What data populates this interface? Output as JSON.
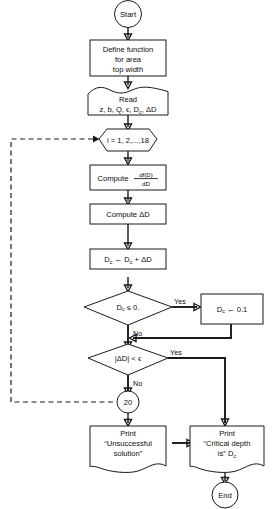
{
  "diagram": {
    "type": "flowchart",
    "stroke_color": "#1a1a1a",
    "background_color": "#ffffff"
  },
  "nodes": {
    "start": {
      "label": "Start",
      "shape": "terminator-circle"
    },
    "define": {
      "line1": "Define function",
      "line2": "for area",
      "line3": "top width",
      "shape": "process-box"
    },
    "read": {
      "line1": "Read",
      "line2": "z, b, Q, ϵ, D",
      "line2_sub": "c",
      "line2_tail": ", ΔD",
      "shape": "input-document"
    },
    "loop": {
      "label": "i = 1, 2,...,18",
      "shape": "hexagon-loop"
    },
    "compute_deriv": {
      "label": "Compute",
      "numerator": "df(D)",
      "denominator": "dD",
      "shape": "process-box"
    },
    "compute_dd": {
      "label": "Compute ΔD",
      "shape": "process-box"
    },
    "update_dc": {
      "pre": "D",
      "pre_sub": "c",
      "mid": "← D",
      "mid_sub": "c",
      "post": "+ ΔD",
      "shape": "process-box"
    },
    "decision_neg": {
      "label": "D",
      "label_sub": "c",
      "label_tail": "≤ 0.",
      "shape": "decision-diamond"
    },
    "set_min": {
      "pre": "D",
      "pre_sub": "c",
      "post": "← 0.1",
      "shape": "process-box"
    },
    "decision_conv": {
      "label": "|ΔD| < ϵ",
      "shape": "decision-diamond"
    },
    "connector_20": {
      "label": "20",
      "shape": "connector-circle"
    },
    "print_fail": {
      "line1": "Print",
      "line2": "“Unsuccessful",
      "line3": "solution”",
      "shape": "output-document"
    },
    "print_ok": {
      "line1": "Print",
      "line2": "“Critical depth",
      "line3": "is” D",
      "line3_sub": "c",
      "shape": "output-document"
    },
    "end": {
      "label": "End",
      "shape": "terminator-circle"
    }
  },
  "edge_labels": {
    "neg_yes": "Yes",
    "neg_no": "No",
    "conv_yes": "Yes",
    "conv_no": "No"
  }
}
